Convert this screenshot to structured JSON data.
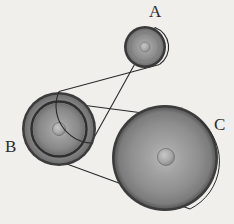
{
  "figure": {
    "title": "",
    "background_color": "#f2f1ee",
    "ink_color": "#2b2b2b",
    "width": 234,
    "height": 224,
    "labels": [
      {
        "id": "A",
        "text": "A",
        "x": 155,
        "y": 11
      },
      {
        "id": "B",
        "text": "B",
        "x": 11,
        "y": 146
      },
      {
        "id": "C",
        "text": "C",
        "x": 220,
        "y": 124
      }
    ],
    "pulleys": [
      {
        "name": "A",
        "label": "A",
        "cx": 145,
        "cy": 47,
        "rim_radius": 21,
        "hub_radius": 5,
        "rim_color": "#3a3a3a",
        "face_color": "#8a8a8a",
        "hub_color": "#9b9b9b",
        "grooves": 1
      },
      {
        "name": "B",
        "label": "B",
        "cx": 59,
        "cy": 129,
        "rim_radius": 37,
        "inner_radius": 27,
        "hub_radius": 6,
        "rim_color": "#3a3a3a",
        "face_color": "#8a8a8a",
        "hub_color": "#9b9b9b",
        "grooves": 2
      },
      {
        "name": "C",
        "label": "C",
        "cx": 165,
        "cy": 158,
        "rim_radius": 53,
        "hub_radius": 8,
        "rim_color": "#3a3a3a",
        "face_color": "#8a8a8a",
        "hub_color": "#a2a2a2",
        "grooves": 1
      }
    ],
    "belts": [
      {
        "name": "belt-a-b",
        "connects": [
          "A",
          "B"
        ],
        "style": "crossed",
        "stroke_color": "#2b2b2b",
        "stroke_width": 1,
        "segments": [
          {
            "x1": 60,
            "y1": 92,
            "x2": 158,
            "y2": 65
          },
          {
            "x1": 90,
            "y1": 141,
            "x2": 155,
            "y2": 28
          }
        ]
      },
      {
        "name": "belt-b-c",
        "connects": [
          "B",
          "C"
        ],
        "style": "crossed",
        "stroke_color": "#2b2b2b",
        "stroke_width": 1,
        "segments": [
          {
            "x1": 61,
            "y1": 102,
            "x2": 199,
            "y2": 120
          },
          {
            "x1": 41,
            "y1": 155,
            "x2": 189,
            "y2": 207
          }
        ]
      }
    ],
    "caption": ""
  }
}
